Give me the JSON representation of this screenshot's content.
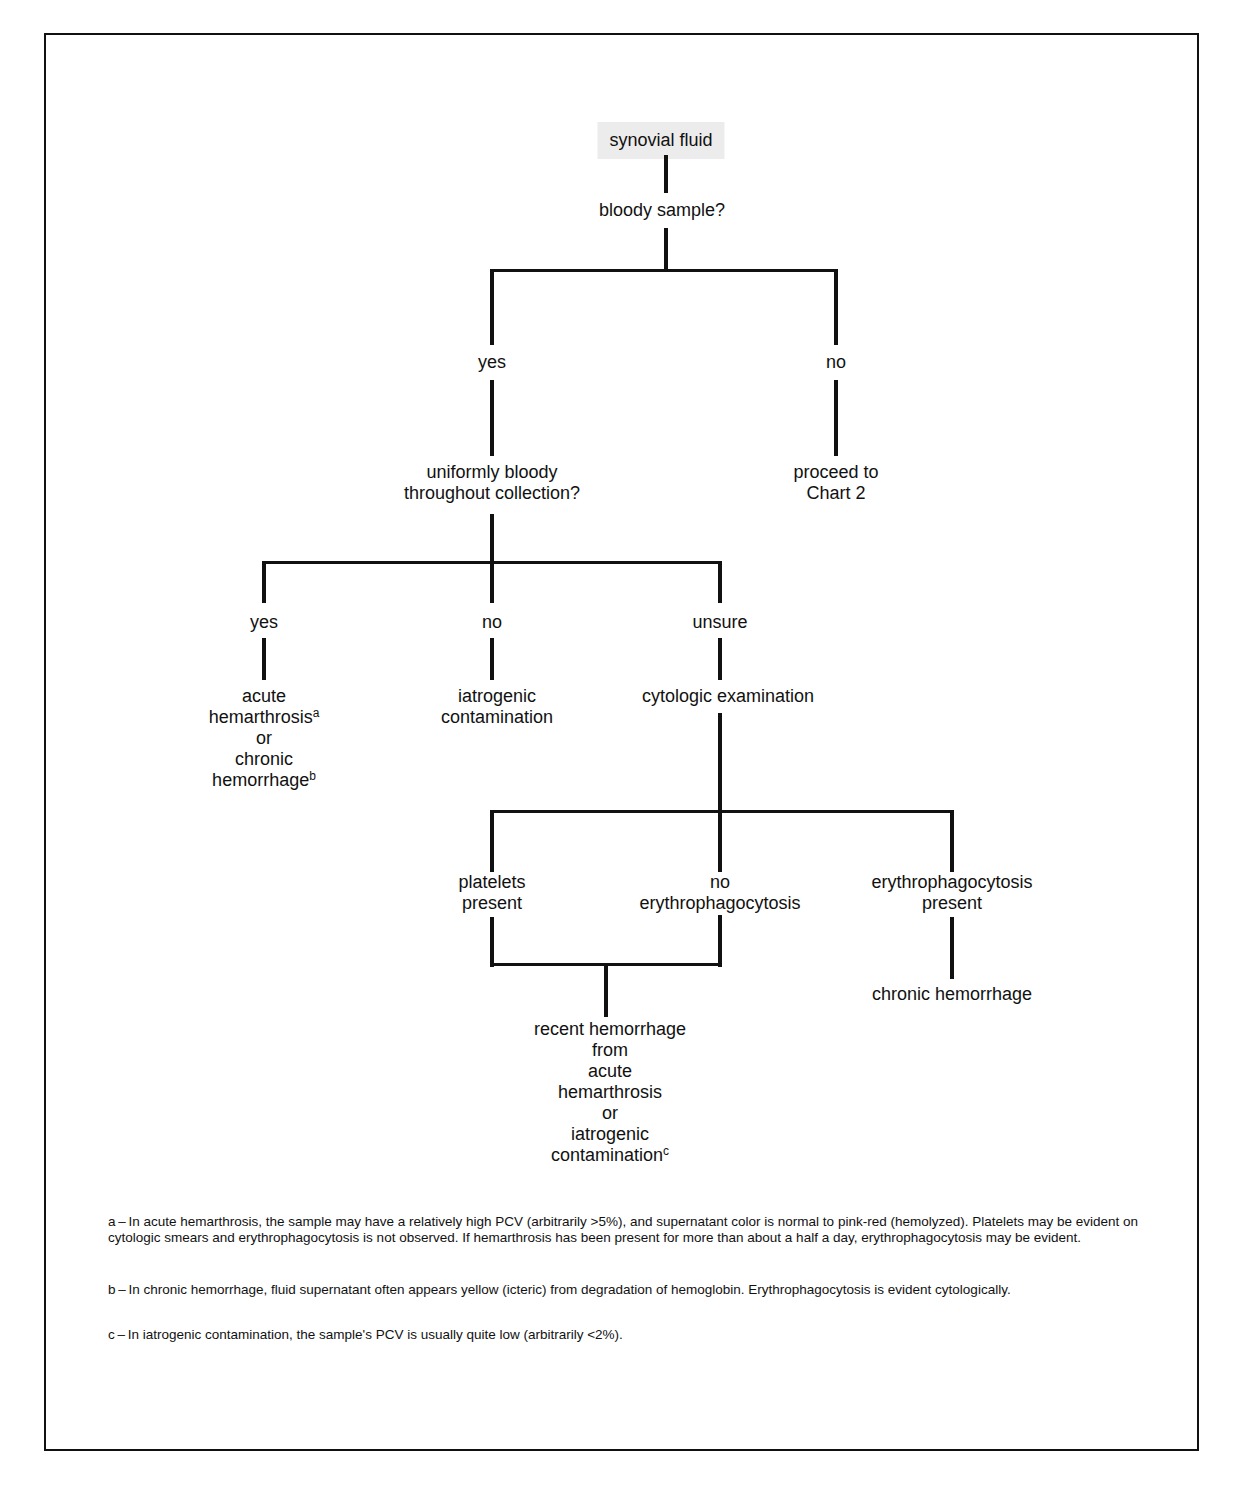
{
  "root": "synovial fluid",
  "q1": "bloody sample?",
  "q1_yes": "yes",
  "q1_no": "no",
  "no_result": [
    "proceed to",
    "Chart 2"
  ],
  "q2": [
    "uniformly bloody",
    "throughout collection?"
  ],
  "q2_yes": "yes",
  "q2_no": "no",
  "q2_unsure": "unsure",
  "yes_result": [
    "acute",
    "hemarthrosis",
    "or",
    "chronic",
    "hemorrhage"
  ],
  "yes_result_sup": [
    "a",
    "b"
  ],
  "no_result2": [
    "iatrogenic",
    "contamination"
  ],
  "cyto": "cytologic examination",
  "c1": [
    "platelets",
    "present"
  ],
  "c2": [
    "no",
    "erythrophagocytosis"
  ],
  "c3": [
    "erythrophagocytosis",
    "present"
  ],
  "c3_result": "chronic hemorrhage",
  "c12_result": [
    "recent hemorrhage",
    "from",
    "acute",
    "hemarthrosis",
    "or",
    "iatrogenic",
    "contamination"
  ],
  "c12_result_sup": "c",
  "footnotes": {
    "a": "a – In acute hemarthrosis, the sample may have a relatively high PCV (arbitrarily >5%), and supernatant color is normal to pink-red (hemolyzed). Platelets may be evident on cytologic smears and erythrophagocytosis is not observed. If hemarthrosis has been present for more than about a half a day, erythrophagocytosis may be evident.",
    "b": "b – In chronic hemorrhage, fluid supernatant often appears yellow (icteric) from degradation of hemoglobin. Erythrophagocytosis is evident cytologically.",
    "c": "c – In iatrogenic contamination, the sample's PCV is usually quite low (arbitrarily <2%)."
  }
}
